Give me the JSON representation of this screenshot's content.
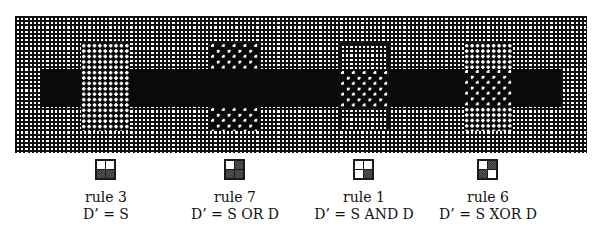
{
  "figure": {
    "destination": {
      "background": "grid",
      "band": "solid black horizontal band"
    },
    "source": {
      "pattern": "checkerboard white dots on black"
    }
  },
  "panels": [
    {
      "rule": "rule 3",
      "equation": "D’ = S",
      "icon": [
        "white",
        "white",
        "gray",
        "gray"
      ]
    },
    {
      "rule": "rule 7",
      "equation": "D’ = S OR D",
      "icon": [
        "white",
        "gray",
        "gray",
        "gray"
      ]
    },
    {
      "rule": "rule 1",
      "equation": "D’ = S AND D",
      "icon": [
        "white",
        "white",
        "white",
        "gray"
      ]
    },
    {
      "rule": "rule 6",
      "equation": "D’ = S XOR D",
      "icon": [
        "white",
        "gray",
        "gray",
        "white"
      ]
    }
  ],
  "colors": {
    "ink": "#111111",
    "paper": "#ffffff"
  }
}
